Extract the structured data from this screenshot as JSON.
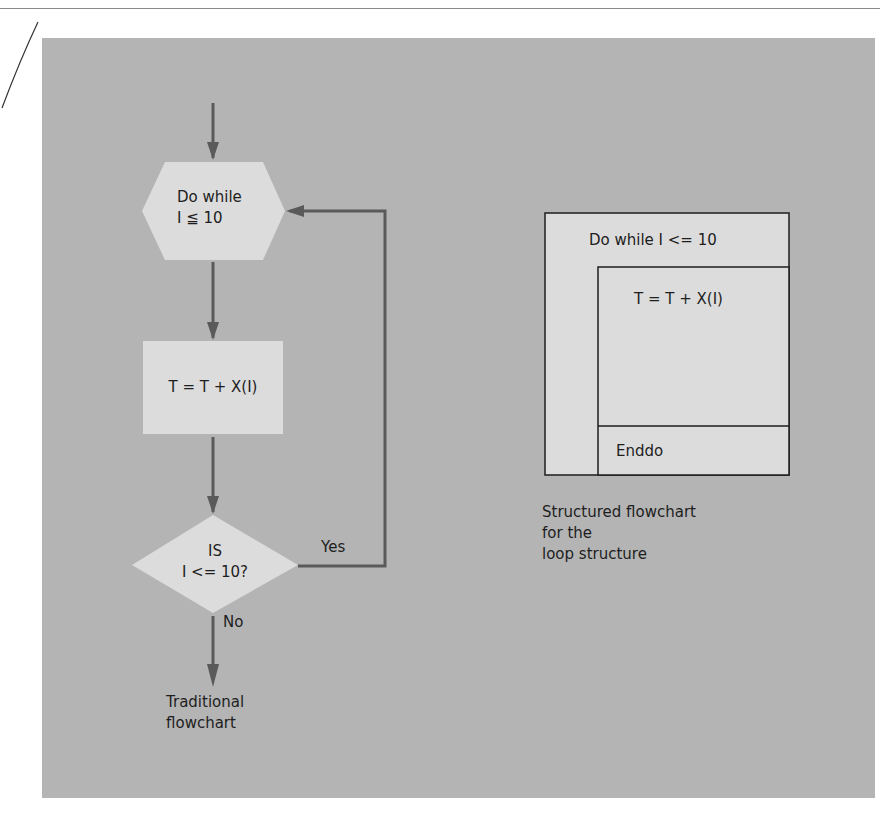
{
  "colors": {
    "panel": "#b4b4b4",
    "shape_fill": "#dcdcdc",
    "arrow": "#5a5a5a",
    "box_stroke": "#1e1e1e"
  },
  "traditional": {
    "start_symbol": {
      "line1": "Do while",
      "line2": "I ≦ 10"
    },
    "process": {
      "label": "T = T + X(I)"
    },
    "decision": {
      "line1": "IS",
      "line2": "I <= 10?"
    },
    "yes_label": "Yes",
    "no_label": "No",
    "caption": {
      "line1": "Traditional",
      "line2": "flowchart"
    }
  },
  "structured": {
    "header": "Do while I <= 10",
    "body": "T = T + X(I)",
    "footer": "Enddo",
    "caption": {
      "line1": "Structured flowchart",
      "line2": "for the",
      "line3": "loop structure"
    }
  }
}
